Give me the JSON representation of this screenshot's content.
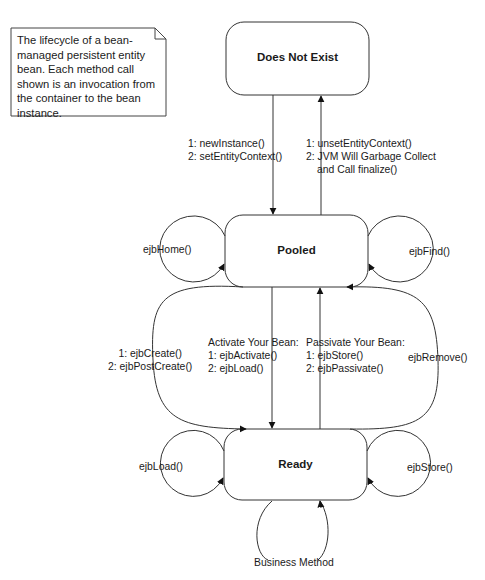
{
  "note": {
    "text": "The lifecycle of a bean-managed persistent entity bean.  Each method call shown is an invocation from the container to the bean instance.",
    "lines": [
      "The lifecycle of a bean-",
      "managed persistent entity",
      "bean.  Each method call",
      "shown is an invocation from",
      "the container to the bean",
      "instance."
    ]
  },
  "states": {
    "does_not_exist": "Does Not Exist",
    "pooled": "Pooled",
    "ready": "Ready"
  },
  "transitions": {
    "to_pooled": [
      "1: newInstance()",
      "2: setEntityContext()"
    ],
    "to_does_not_exist": [
      "1: unsetEntityContext()",
      "2: JVM Will Garbage Collect",
      "and Call finalize()"
    ],
    "pooled_self_left": "ejbHome()",
    "pooled_self_right": "ejbFind()",
    "create": [
      "1: ejbCreate()",
      "2: ejbPostCreate()"
    ],
    "activate": [
      "Activate Your Bean:",
      "1: ejbActivate()",
      "2: ejbLoad()"
    ],
    "passivate": [
      "Passivate Your Bean:",
      "1: ejbStore()",
      "2: ejbPassivate()"
    ],
    "remove": "ejbRemove()",
    "ready_self_left": "ejbLoad()",
    "ready_self_right": "ejbStore()",
    "ready_self_bottom": "Business Method"
  },
  "colors": {
    "stroke": "#333333",
    "text": "#1a1a1a",
    "background": "#ffffff"
  }
}
